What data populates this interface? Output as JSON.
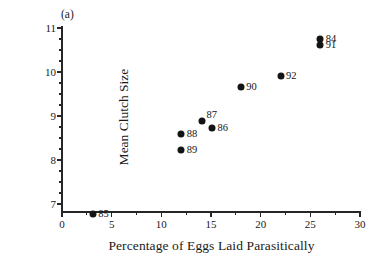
{
  "figure": {
    "panel_label": "(a)",
    "background_color": "#ffffff",
    "marker_color": "#141414",
    "axis_color": "#262626"
  },
  "chart_data": {
    "type": "scatter",
    "title": "",
    "xlabel": "Percentage of Eggs Laid Parasitically",
    "ylabel": "Mean Clutch Size",
    "xlim": [
      0,
      30
    ],
    "ylim": [
      6.6,
      11.1
    ],
    "xticks": [
      0,
      5,
      10,
      15,
      20,
      25,
      30
    ],
    "xticklabels": [
      "0",
      "5",
      "10",
      "15",
      "20",
      "25",
      "30"
    ],
    "yticks": [
      7,
      8,
      9,
      10,
      11
    ],
    "yticklabels": [
      "7",
      "8",
      "9",
      "10",
      "11"
    ],
    "x_minor_interval": 2.5,
    "y_minor_interval": 0.25,
    "grid": false,
    "legend": false,
    "points": [
      {
        "label": "85",
        "x": 3.1,
        "y": 6.78,
        "label_pos": "right"
      },
      {
        "label": "89",
        "x": 12.0,
        "y": 8.22,
        "label_pos": "right"
      },
      {
        "label": "88",
        "x": 12.0,
        "y": 8.6,
        "label_pos": "right"
      },
      {
        "label": "87",
        "x": 14.1,
        "y": 8.88,
        "label_pos": "upper-right"
      },
      {
        "label": "86",
        "x": 15.1,
        "y": 8.73,
        "label_pos": "right"
      },
      {
        "label": "90",
        "x": 18.0,
        "y": 9.65,
        "label_pos": "right"
      },
      {
        "label": "92",
        "x": 22.0,
        "y": 9.9,
        "label_pos": "right"
      },
      {
        "label": "84",
        "x": 26.0,
        "y": 10.75,
        "label_pos": "right"
      },
      {
        "label": "91",
        "x": 26.0,
        "y": 10.62,
        "label_pos": "right"
      }
    ]
  }
}
